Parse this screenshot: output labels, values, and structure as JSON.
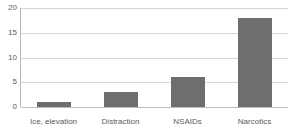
{
  "chart_data": {
    "type": "bar",
    "title": "",
    "subtitle": "",
    "xlabel": "",
    "ylabel": "",
    "categories": [
      "Ice, elevation",
      "Distraction",
      "NSAIDs",
      "Narcotics"
    ],
    "values": [
      1,
      3,
      6,
      18
    ],
    "ylim": [
      0,
      20
    ],
    "yticks": [
      0,
      5,
      10,
      15,
      20
    ],
    "ytick_labels": [
      "0",
      "5",
      "10",
      "15",
      "20"
    ],
    "grid": true,
    "grid_axis": "y",
    "legend": false,
    "legend_position": "none",
    "annotations": [],
    "colors": {
      "bar": "#6e6e6e",
      "gridline": "#d6d6d6",
      "axis": "#b8b8b8",
      "tick_label": "#5a5a5a",
      "background": "#ffffff"
    }
  }
}
